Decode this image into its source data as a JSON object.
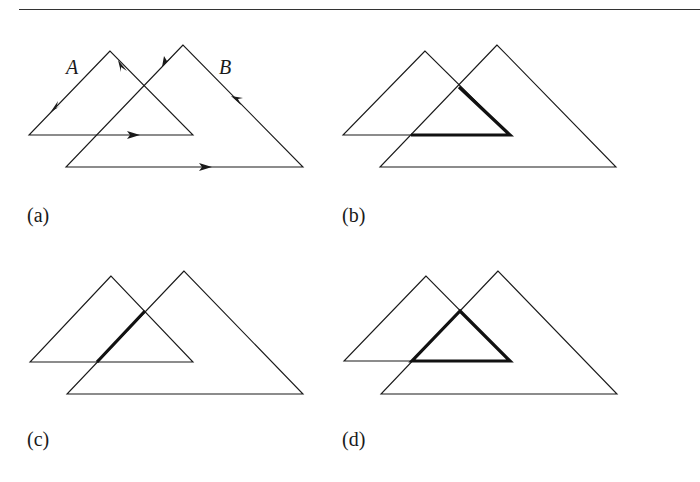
{
  "figure": {
    "shape_labels": {
      "a": "A",
      "b": "B"
    },
    "panels": [
      {
        "id": "a",
        "label": "(a)",
        "description": "Two overlapping triangles A and B with directed edges (arrows) showing traversal orientation"
      },
      {
        "id": "b",
        "label": "(b)",
        "description": "Portion of triangle A's boundary lying inside B highlighted in bold"
      },
      {
        "id": "c",
        "label": "(c)",
        "description": "Portion of triangle B's boundary lying inside A highlighted in bold"
      },
      {
        "id": "d",
        "label": "(d)",
        "description": "Intersection region A ∩ B outlined in bold"
      }
    ],
    "colors": {
      "stroke": "#1a1a1a",
      "bold_stroke": "#111111",
      "background": "#ffffff"
    }
  }
}
